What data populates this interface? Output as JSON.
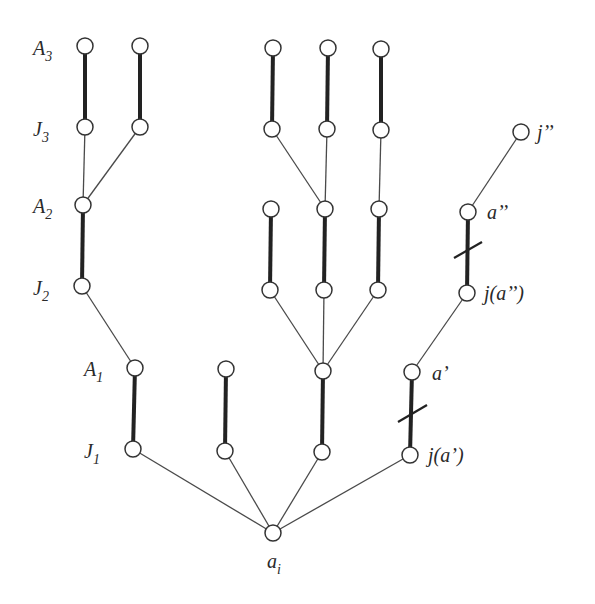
{
  "diagram": {
    "type": "tree",
    "node_radius": 8,
    "colors": {
      "node_fill": "#ffffff",
      "node_stroke": "#333333",
      "edge": "#4a4a4a",
      "thick_edge": "#222222"
    },
    "level_labels": [
      {
        "id": "A3",
        "main": "A",
        "sub": "3",
        "x": 33,
        "y": 55
      },
      {
        "id": "J3",
        "main": "J",
        "sub": "3",
        "x": 33,
        "y": 136
      },
      {
        "id": "A2",
        "main": "A",
        "sub": "2",
        "x": 33,
        "y": 213
      },
      {
        "id": "J2",
        "main": "J",
        "sub": "2",
        "x": 33,
        "y": 295
      },
      {
        "id": "A1",
        "main": "A",
        "sub": "1",
        "x": 84,
        "y": 376
      },
      {
        "id": "J1",
        "main": "J",
        "sub": "1",
        "x": 84,
        "y": 458
      }
    ],
    "node_labels": [
      {
        "id": "ai",
        "main": "a",
        "sub": "i",
        "x": 267,
        "y": 568
      },
      {
        "id": "jpp",
        "text": "j’’",
        "x": 537,
        "y": 139
      },
      {
        "id": "app",
        "text": "a’’",
        "x": 487,
        "y": 219
      },
      {
        "id": "jappp",
        "text": "j(a’’)",
        "x": 484,
        "y": 300
      },
      {
        "id": "ap",
        "text": "a’",
        "x": 432,
        "y": 380
      },
      {
        "id": "jap",
        "text": "j(a’)",
        "x": 428,
        "y": 462
      }
    ],
    "nodes": [
      {
        "id": "root",
        "x": 273,
        "y": 533
      },
      {
        "id": "J1a",
        "x": 133,
        "y": 449
      },
      {
        "id": "A1a",
        "x": 135,
        "y": 368
      },
      {
        "id": "J2",
        "x": 82,
        "y": 286
      },
      {
        "id": "A2",
        "x": 83,
        "y": 205
      },
      {
        "id": "J3a",
        "x": 85,
        "y": 127
      },
      {
        "id": "A3a",
        "x": 85,
        "y": 46
      },
      {
        "id": "J3b",
        "x": 140,
        "y": 127
      },
      {
        "id": "A3b",
        "x": 140,
        "y": 46
      },
      {
        "id": "J1b",
        "x": 225,
        "y": 451
      },
      {
        "id": "A1b",
        "x": 226,
        "y": 369
      },
      {
        "id": "J1c",
        "x": 322,
        "y": 452
      },
      {
        "id": "A1c",
        "x": 323,
        "y": 371
      },
      {
        "id": "J2a",
        "x": 270,
        "y": 290
      },
      {
        "id": "A2a",
        "x": 271,
        "y": 209
      },
      {
        "id": "J2b",
        "x": 324,
        "y": 290
      },
      {
        "id": "A2b",
        "x": 325,
        "y": 209
      },
      {
        "id": "J2c",
        "x": 378,
        "y": 290
      },
      {
        "id": "A2c",
        "x": 379,
        "y": 209
      },
      {
        "id": "J3c",
        "x": 272,
        "y": 129
      },
      {
        "id": "A3c",
        "x": 273,
        "y": 48
      },
      {
        "id": "J3d",
        "x": 327,
        "y": 129
      },
      {
        "id": "A3d",
        "x": 328,
        "y": 48
      },
      {
        "id": "J3e",
        "x": 381,
        "y": 130
      },
      {
        "id": "A3e",
        "x": 381,
        "y": 49
      },
      {
        "id": "jap",
        "x": 410,
        "y": 455
      },
      {
        "id": "ap",
        "x": 412,
        "y": 372
      },
      {
        "id": "japp",
        "x": 467,
        "y": 293
      },
      {
        "id": "app",
        "x": 468,
        "y": 212
      },
      {
        "id": "jpp",
        "x": 521,
        "y": 132
      }
    ],
    "thin_edges": [
      [
        "root",
        "J1a"
      ],
      [
        "root",
        "J1b"
      ],
      [
        "root",
        "J1c"
      ],
      [
        "root",
        "jap"
      ],
      [
        "J1a",
        "A1a"
      ],
      [
        "A1a",
        "J2"
      ],
      [
        "A2",
        "J3a"
      ],
      [
        "A2",
        "J3b"
      ],
      [
        "A1c",
        "J2a"
      ],
      [
        "A1c",
        "J2b"
      ],
      [
        "A1c",
        "J2c"
      ],
      [
        "A2b",
        "J3c"
      ],
      [
        "A2b",
        "J3d"
      ],
      [
        "A2c",
        "J3e"
      ],
      [
        "ap",
        "japp"
      ],
      [
        "app",
        "jpp"
      ]
    ],
    "thick_edges": [
      [
        "A1a",
        "J1a"
      ],
      [
        "A2",
        "J2"
      ],
      [
        "A3a",
        "J3a"
      ],
      [
        "A3b",
        "J3b"
      ],
      [
        "A1b",
        "J1b"
      ],
      [
        "A1c",
        "J1c"
      ],
      [
        "A2a",
        "J2a"
      ],
      [
        "A2b",
        "J2b"
      ],
      [
        "A2c",
        "J2c"
      ],
      [
        "A3c",
        "J3c"
      ],
      [
        "A3d",
        "J3d"
      ],
      [
        "A3e",
        "J3e"
      ],
      [
        "ap",
        "jap"
      ],
      [
        "app",
        "japp"
      ]
    ],
    "cross_marks": [
      {
        "on": "ap-jap",
        "x1": 398,
        "y1": 422,
        "x2": 427,
        "y2": 405
      },
      {
        "on": "app-japp",
        "x1": 454,
        "y1": 258,
        "x2": 482,
        "y2": 242
      }
    ]
  }
}
